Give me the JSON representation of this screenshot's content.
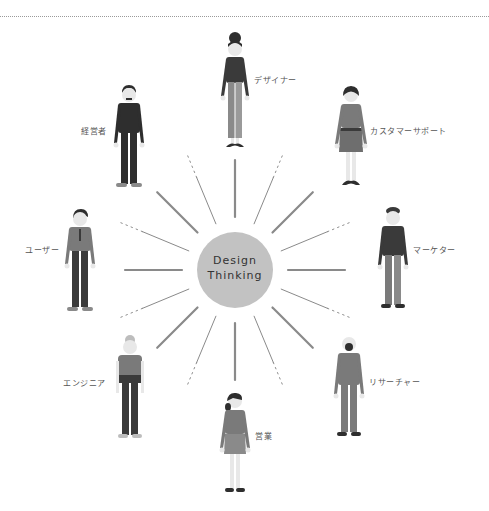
{
  "hub": {
    "line1": "Design",
    "line2": "Thinking",
    "fill": "#c2c2c2"
  },
  "colors": {
    "ray": "#8a8a8a",
    "suit_dark": "#3a3a3a",
    "suit_mid": "#7a7a7a",
    "skin": "#e8e8e8",
    "hair": "#2e2e2e",
    "divider": "#9a9a9a"
  },
  "personas": [
    {
      "id": "designer",
      "label": "デザイナー"
    },
    {
      "id": "customer-support",
      "label": "カスタマーサポート"
    },
    {
      "id": "marketer",
      "label": "マーケター"
    },
    {
      "id": "researcher",
      "label": "リサーチャー"
    },
    {
      "id": "sales",
      "label": "営業"
    },
    {
      "id": "engineer",
      "label": "エンジニア"
    },
    {
      "id": "user",
      "label": "ユーザー"
    },
    {
      "id": "executive",
      "label": "経営者"
    }
  ]
}
